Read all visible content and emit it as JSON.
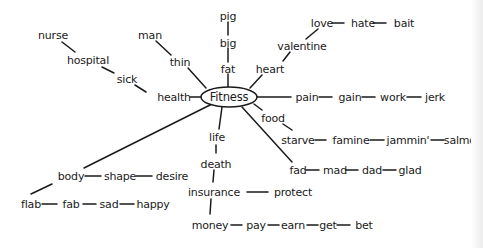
{
  "diagram": {
    "center": {
      "label": "Fitness",
      "x": 229,
      "y": 97
    },
    "ink_color": "#1a1a1a",
    "words": [
      {
        "id": "pig",
        "label": "pig",
        "x": 228,
        "y": 16
      },
      {
        "id": "big",
        "label": "big",
        "x": 228,
        "y": 43
      },
      {
        "id": "fat",
        "label": "fat",
        "x": 228,
        "y": 69
      },
      {
        "id": "man",
        "label": "man",
        "x": 150,
        "y": 35
      },
      {
        "id": "thin",
        "label": "thin",
        "x": 180,
        "y": 62
      },
      {
        "id": "nurse",
        "label": "nurse",
        "x": 53,
        "y": 35
      },
      {
        "id": "hospital",
        "label": "hospital",
        "x": 88,
        "y": 60
      },
      {
        "id": "sick",
        "label": "sick",
        "x": 127,
        "y": 79
      },
      {
        "id": "health",
        "label": "health",
        "x": 174,
        "y": 97
      },
      {
        "id": "love",
        "label": "love",
        "x": 322,
        "y": 23
      },
      {
        "id": "hate",
        "label": "hate",
        "x": 363,
        "y": 23
      },
      {
        "id": "bait",
        "label": "bait",
        "x": 404,
        "y": 23
      },
      {
        "id": "valentine",
        "label": "valentine",
        "x": 302,
        "y": 46
      },
      {
        "id": "heart",
        "label": "heart",
        "x": 270,
        "y": 69
      },
      {
        "id": "pain",
        "label": "pain",
        "x": 307,
        "y": 97
      },
      {
        "id": "gain",
        "label": "gain",
        "x": 350,
        "y": 97
      },
      {
        "id": "work",
        "label": "work",
        "x": 393,
        "y": 97
      },
      {
        "id": "jerk",
        "label": "jerk",
        "x": 435,
        "y": 97
      },
      {
        "id": "food",
        "label": "food",
        "x": 273,
        "y": 118
      },
      {
        "id": "starve",
        "label": "starve",
        "x": 298,
        "y": 140
      },
      {
        "id": "famine",
        "label": "famine",
        "x": 351,
        "y": 140
      },
      {
        "id": "jammin",
        "label": "jammin'",
        "x": 408,
        "y": 140
      },
      {
        "id": "salmon",
        "label": "salmor",
        "x": 462,
        "y": 140
      },
      {
        "id": "fad",
        "label": "fad",
        "x": 298,
        "y": 170
      },
      {
        "id": "mad",
        "label": "mad",
        "x": 335,
        "y": 170
      },
      {
        "id": "dad",
        "label": "dad",
        "x": 372,
        "y": 170
      },
      {
        "id": "glad",
        "label": "glad",
        "x": 410,
        "y": 170
      },
      {
        "id": "life",
        "label": "life",
        "x": 217,
        "y": 137
      },
      {
        "id": "death",
        "label": "death",
        "x": 216,
        "y": 164
      },
      {
        "id": "insurance",
        "label": "insurance",
        "x": 214,
        "y": 192
      },
      {
        "id": "protect",
        "label": "protect",
        "x": 293,
        "y": 192
      },
      {
        "id": "money",
        "label": "money",
        "x": 210,
        "y": 225
      },
      {
        "id": "pay",
        "label": "pay",
        "x": 256,
        "y": 225
      },
      {
        "id": "earn",
        "label": "earn",
        "x": 293,
        "y": 225
      },
      {
        "id": "get",
        "label": "get",
        "x": 328,
        "y": 225
      },
      {
        "id": "bet",
        "label": "bet",
        "x": 364,
        "y": 225
      },
      {
        "id": "body",
        "label": "body",
        "x": 71,
        "y": 176
      },
      {
        "id": "shape",
        "label": "shape",
        "x": 120,
        "y": 176
      },
      {
        "id": "desire",
        "label": "desire",
        "x": 172,
        "y": 176
      },
      {
        "id": "flab",
        "label": "flab",
        "x": 31,
        "y": 204
      },
      {
        "id": "fab",
        "label": "fab",
        "x": 71,
        "y": 204
      },
      {
        "id": "sad",
        "label": "sad",
        "x": 109,
        "y": 204
      },
      {
        "id": "happy",
        "label": "happy",
        "x": 153,
        "y": 204
      }
    ],
    "edges": [
      [
        228,
        22,
        228,
        35
      ],
      [
        228,
        48,
        228,
        62
      ],
      [
        228,
        74,
        228,
        87
      ],
      [
        156,
        41,
        171,
        55
      ],
      [
        188,
        68,
        206,
        88
      ],
      [
        62,
        42,
        75,
        52
      ],
      [
        102,
        67,
        114,
        73
      ],
      [
        135,
        85,
        146,
        92
      ],
      [
        190,
        97,
        201,
        97
      ],
      [
        318,
        29,
        306,
        39
      ],
      [
        290,
        52,
        283,
        61
      ],
      [
        262,
        75,
        250,
        88
      ],
      [
        332,
        23,
        344,
        23
      ],
      [
        373,
        23,
        386,
        23
      ],
      [
        257,
        97,
        291,
        97
      ],
      [
        319,
        97,
        332,
        97
      ],
      [
        362,
        97,
        375,
        97
      ],
      [
        407,
        97,
        421,
        97
      ],
      [
        254,
        104,
        262,
        110
      ],
      [
        283,
        124,
        292,
        130
      ],
      [
        315,
        140,
        326,
        140
      ],
      [
        370,
        140,
        384,
        140
      ],
      [
        431,
        140,
        444,
        140
      ],
      [
        306,
        170,
        319,
        170
      ],
      [
        346,
        170,
        358,
        170
      ],
      [
        383,
        170,
        396,
        170
      ],
      [
        242,
        107,
        292,
        162
      ],
      [
        222,
        107,
        219,
        129
      ],
      [
        216,
        145,
        216,
        153
      ],
      [
        214,
        170,
        213,
        182
      ],
      [
        211,
        199,
        210,
        214
      ],
      [
        247,
        192,
        268,
        192
      ],
      [
        231,
        225,
        242,
        225
      ],
      [
        268,
        225,
        279,
        225
      ],
      [
        307,
        225,
        318,
        225
      ],
      [
        337,
        225,
        350,
        225
      ],
      [
        212,
        104,
        84,
        168
      ],
      [
        85,
        176,
        101,
        176
      ],
      [
        136,
        176,
        152,
        176
      ],
      [
        52,
        184,
        31,
        194
      ],
      [
        42,
        204,
        57,
        204
      ],
      [
        83,
        204,
        96,
        204
      ],
      [
        120,
        204,
        134,
        204
      ]
    ]
  }
}
